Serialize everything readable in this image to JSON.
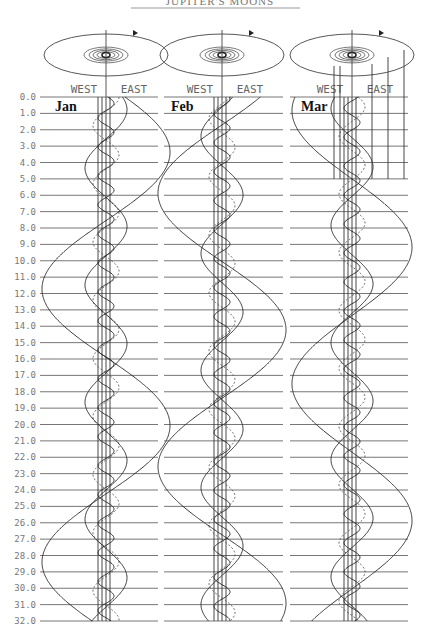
{
  "header": {
    "title": "JUPITER'S MOONS"
  },
  "chart_data": {
    "type": "line",
    "title": "Jupiter's Moons",
    "ylabel": "Day of month",
    "ylim": [
      0,
      32
    ],
    "y_ticks": [
      "0.0",
      "1.0",
      "2.0",
      "3.0",
      "4.0",
      "5.0",
      "6.0",
      "7.0",
      "8.0",
      "9.0",
      "10.0",
      "11.0",
      "12.0",
      "13.0",
      "14.0",
      "15.0",
      "16.0",
      "17.0",
      "18.0",
      "19.0",
      "20.0",
      "21.0",
      "22.0",
      "23.0",
      "24.0",
      "25.0",
      "26.0",
      "27.0",
      "28.0",
      "29.0",
      "30.0",
      "31.0",
      "32.0"
    ],
    "direction_labels": {
      "west": "WEST",
      "east": "EAST"
    },
    "panels": [
      {
        "month": "Jan",
        "center_x": 106,
        "series": [
          {
            "name": "Io",
            "amplitude": 8,
            "period": 1.77,
            "phase": 0.2,
            "style": "solid"
          },
          {
            "name": "Europa",
            "amplitude": 13,
            "period": 3.55,
            "phase": 1.6,
            "style": "dashed"
          },
          {
            "name": "Ganymede",
            "amplitude": 21,
            "period": 7.15,
            "phase": 0.9,
            "style": "solid"
          },
          {
            "name": "Callisto",
            "amplitude": 64,
            "period": 16.69,
            "phase": 0.3,
            "style": "solid"
          }
        ]
      },
      {
        "month": "Feb",
        "center_x": 222,
        "series": [
          {
            "name": "Io",
            "amplitude": 8,
            "period": 1.77,
            "phase": 1.1,
            "style": "solid"
          },
          {
            "name": "Europa",
            "amplitude": 13,
            "period": 3.55,
            "phase": 2.4,
            "style": "dashed"
          },
          {
            "name": "Ganymede",
            "amplitude": 21,
            "period": 7.15,
            "phase": 2.6,
            "style": "solid"
          },
          {
            "name": "Callisto",
            "amplitude": 64,
            "period": 16.69,
            "phase": 2.5,
            "style": "solid"
          }
        ]
      },
      {
        "month": "Mar",
        "center_x": 352,
        "series": [
          {
            "name": "Io",
            "amplitude": 8,
            "period": 1.77,
            "phase": 2.3,
            "style": "solid"
          },
          {
            "name": "Europa",
            "amplitude": 13,
            "period": 3.55,
            "phase": 0.5,
            "style": "dashed"
          },
          {
            "name": "Ganymede",
            "amplitude": 21,
            "period": 7.15,
            "phase": 4.1,
            "style": "solid"
          },
          {
            "name": "Callisto",
            "amplitude": 60,
            "period": 16.69,
            "phase": 4.4,
            "style": "solid"
          }
        ]
      }
    ],
    "legend_position": "none",
    "grid": true
  }
}
